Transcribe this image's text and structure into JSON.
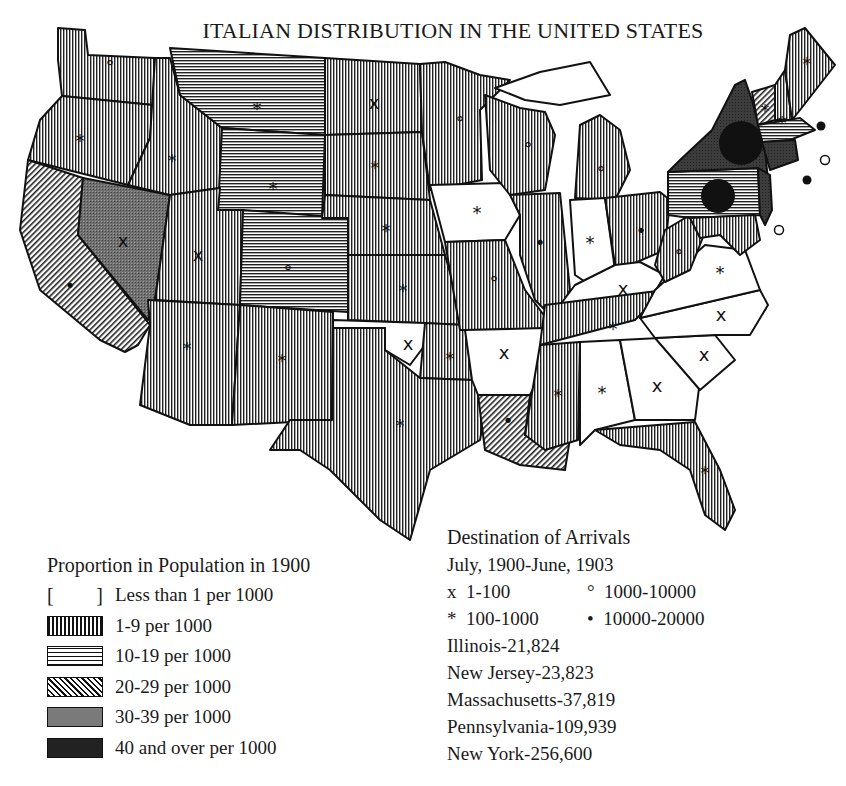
{
  "title": "ITALIAN DISTRIBUTION IN THE UNITED STATES",
  "colors": {
    "ink": "#111111",
    "paper": "#ffffff",
    "light_fill": "#bdbdbd",
    "mid_fill": "#8e8e8e",
    "dark_fill": "#4a4a4a",
    "black_fill": "#1a1a1a"
  },
  "proportion_legend": {
    "heading": "Proportion in Population in 1900",
    "items": [
      {
        "pattern": "blank",
        "bracket_left": "[",
        "bracket_right": "]",
        "label": "Less than 1 per 1000"
      },
      {
        "pattern": "vertical-lines",
        "label": "1-9 per 1000"
      },
      {
        "pattern": "horizontal-lines",
        "label": "10-19 per 1000"
      },
      {
        "pattern": "diagonal-lines",
        "label": "20-29 per 1000"
      },
      {
        "pattern": "stipple-gray",
        "label": "30-39 per 1000"
      },
      {
        "pattern": "dark-solid",
        "label": "40 and over per 1000"
      }
    ]
  },
  "arrivals_legend": {
    "heading": "Destination of Arrivals",
    "period": "July, 1900-June, 1903",
    "symbols": [
      {
        "glyph": "x",
        "label": "1-100"
      },
      {
        "glyph": "°",
        "label": "1000-10000"
      },
      {
        "glyph": "*",
        "label": "100-1000"
      },
      {
        "glyph": "•",
        "label": "10000-20000"
      }
    ],
    "top_states": [
      "Illinois-21,824",
      "New Jersey-23,823",
      "Massachusetts-37,819",
      "Pennsylvania-109,939",
      "New York-256,600"
    ]
  },
  "states": [
    {
      "name": "Washington",
      "pattern": "vertical-lines",
      "symbol": "°"
    },
    {
      "name": "Oregon",
      "pattern": "vertical-lines",
      "symbol": "*"
    },
    {
      "name": "California",
      "pattern": "diagonal-lines",
      "symbol": "•"
    },
    {
      "name": "Nevada",
      "pattern": "stipple-gray",
      "symbol": "x"
    },
    {
      "name": "Idaho",
      "pattern": "vertical-lines",
      "symbol": "*"
    },
    {
      "name": "Montana",
      "pattern": "horizontal-lines",
      "symbol": "*"
    },
    {
      "name": "Wyoming",
      "pattern": "horizontal-lines",
      "symbol": "*"
    },
    {
      "name": "Utah",
      "pattern": "vertical-lines",
      "symbol": "x"
    },
    {
      "name": "Colorado",
      "pattern": "horizontal-lines",
      "symbol": "°"
    },
    {
      "name": "Arizona",
      "pattern": "vertical-lines",
      "symbol": "*"
    },
    {
      "name": "New Mexico",
      "pattern": "vertical-lines",
      "symbol": "*"
    },
    {
      "name": "North Dakota",
      "pattern": "vertical-lines",
      "symbol": "x"
    },
    {
      "name": "South Dakota",
      "pattern": "vertical-lines",
      "symbol": "*"
    },
    {
      "name": "Nebraska",
      "pattern": "vertical-lines",
      "symbol": "*"
    },
    {
      "name": "Kansas",
      "pattern": "vertical-lines",
      "symbol": "*"
    },
    {
      "name": "Oklahoma",
      "pattern": "blank",
      "symbol": "x"
    },
    {
      "name": "Indian Territory",
      "pattern": "vertical-lines",
      "symbol": "*"
    },
    {
      "name": "Texas",
      "pattern": "vertical-lines",
      "symbol": "*"
    },
    {
      "name": "Minnesota",
      "pattern": "vertical-lines",
      "symbol": "°"
    },
    {
      "name": "Iowa",
      "pattern": "blank",
      "symbol": "*"
    },
    {
      "name": "Missouri",
      "pattern": "vertical-lines",
      "symbol": "°"
    },
    {
      "name": "Arkansas",
      "pattern": "blank",
      "symbol": "x"
    },
    {
      "name": "Louisiana",
      "pattern": "diagonal-lines",
      "symbol": "•"
    },
    {
      "name": "Wisconsin",
      "pattern": "vertical-lines",
      "symbol": "°"
    },
    {
      "name": "Illinois",
      "pattern": "vertical-lines",
      "symbol": "•"
    },
    {
      "name": "Michigan",
      "pattern": "vertical-lines",
      "symbol": "°"
    },
    {
      "name": "Indiana",
      "pattern": "blank",
      "symbol": "*"
    },
    {
      "name": "Ohio",
      "pattern": "vertical-lines",
      "symbol": "•"
    },
    {
      "name": "Kentucky",
      "pattern": "blank",
      "symbol": "x"
    },
    {
      "name": "Tennessee",
      "pattern": "vertical-lines",
      "symbol": "*"
    },
    {
      "name": "Mississippi",
      "pattern": "vertical-lines",
      "symbol": "*"
    },
    {
      "name": "Alabama",
      "pattern": "blank",
      "symbol": "*"
    },
    {
      "name": "Georgia",
      "pattern": "blank",
      "symbol": "x"
    },
    {
      "name": "Florida",
      "pattern": "vertical-lines",
      "symbol": "*"
    },
    {
      "name": "South Carolina",
      "pattern": "blank",
      "symbol": "x"
    },
    {
      "name": "North Carolina",
      "pattern": "blank",
      "symbol": "x"
    },
    {
      "name": "Virginia",
      "pattern": "blank",
      "symbol": "*"
    },
    {
      "name": "West Virginia",
      "pattern": "vertical-lines",
      "symbol": "°"
    },
    {
      "name": "Pennsylvania",
      "pattern": "horizontal-lines",
      "symbol": "large-dot"
    },
    {
      "name": "New York",
      "pattern": "stipple-dark",
      "symbol": "large-dot"
    },
    {
      "name": "New Jersey",
      "pattern": "stipple-dark",
      "symbol": "•"
    },
    {
      "name": "Maryland",
      "pattern": "vertical-lines",
      "symbol": "°"
    },
    {
      "name": "Delaware",
      "pattern": "vertical-lines",
      "symbol": "°"
    },
    {
      "name": "Vermont",
      "pattern": "diagonal-lines",
      "symbol": "*"
    },
    {
      "name": "New Hampshire",
      "pattern": "vertical-lines",
      "symbol": "*"
    },
    {
      "name": "Maine",
      "pattern": "vertical-lines",
      "symbol": "*"
    },
    {
      "name": "Massachusetts",
      "pattern": "horizontal-lines",
      "symbol": "•"
    },
    {
      "name": "Rhode Island",
      "pattern": "stipple-dark",
      "symbol": "°"
    },
    {
      "name": "Connecticut",
      "pattern": "stipple-dark",
      "symbol": "•"
    }
  ]
}
